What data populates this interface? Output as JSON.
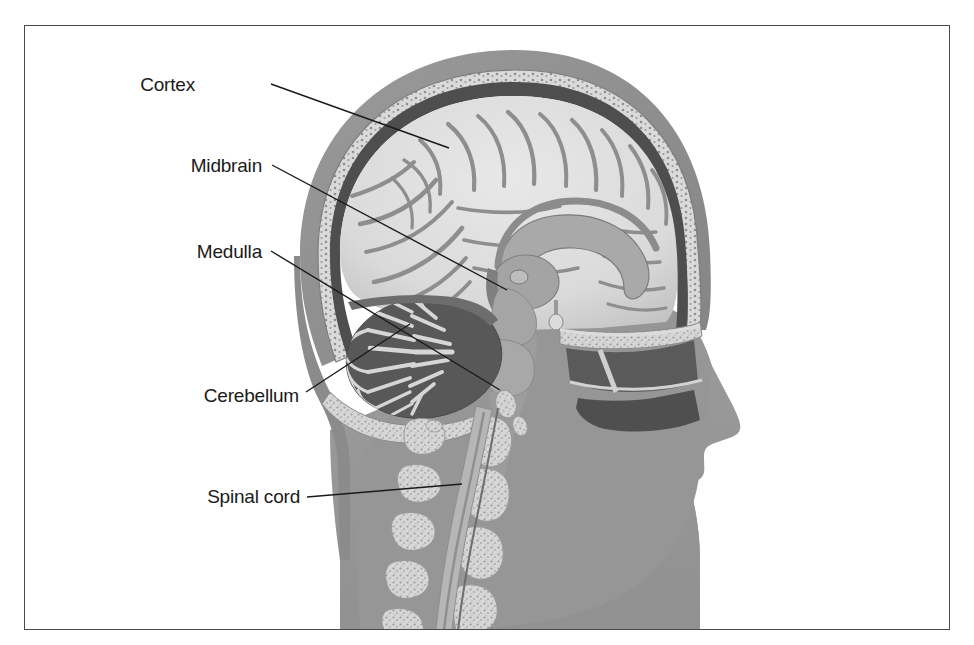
{
  "figure": {
    "kind": "anatomical-illustration",
    "view": "lateral midsagittal cutaway, facing right",
    "border_color": "#4a4a4a",
    "background_color": "#ffffff",
    "top_partial_text": ""
  },
  "palette": {
    "page_background": "#ffffff",
    "frame_border": "#4a4a4a",
    "label_text": "#1a1a1a",
    "leader_line": "#1a1a1a",
    "scalp_outer": "#8e8e8e",
    "scalp_dark": "#6f6f6f",
    "skull_bone": "#d2d2d2",
    "dura_dark": "#4e4e4e",
    "brain_tissue": "#dcdcdc",
    "brain_sulci": "#8a8a8a",
    "brainstem": "#9d9d9d",
    "cerebellum_light": "#d8d8d8",
    "cerebellum_dark": "#5e5e5e",
    "face_silhouette": "#969696",
    "vertebra_bone": "#d9d9d9",
    "sinus_cavity": "#5a5a5a",
    "spinal_canal": "#b0b0b0"
  },
  "labels": [
    {
      "id": "cortex",
      "text": "Cortex",
      "text_x": 195,
      "text_y": 91,
      "leader": "M271,84 L449,148",
      "target_structure": "cerebral cortex"
    },
    {
      "id": "midbrain",
      "text": "Midbrain",
      "text_x": 183,
      "text_y": 172,
      "leader": "M272,165 L507,290",
      "target_structure": "midbrain"
    },
    {
      "id": "medulla",
      "text": "Medulla",
      "text_x": 190,
      "text_y": 258,
      "leader": "M271,251 L500,390",
      "target_structure": "medulla oblongata"
    },
    {
      "id": "cerebellum",
      "text": "Cerebellum",
      "text_x": 186,
      "text_y": 402,
      "leader": "M303,394 L408,325",
      "target_structure": "cerebellum"
    },
    {
      "id": "spinal-cord",
      "text": "Spinal cord",
      "text_x": 194,
      "text_y": 502,
      "leader": "M303,497 L460,485",
      "target_structure": "spinal cord"
    }
  ],
  "structures": [
    {
      "id": "scalp",
      "name": "Scalp / outer soft tissue"
    },
    {
      "id": "skull",
      "name": "Skull bone (diploe)"
    },
    {
      "id": "dura",
      "name": "Dura mater"
    },
    {
      "id": "cerebrum",
      "name": "Cerebral hemisphere with gyri and sulci"
    },
    {
      "id": "corpus-callosum",
      "name": "Corpus callosum"
    },
    {
      "id": "thalamus",
      "name": "Thalamus"
    },
    {
      "id": "midbrain",
      "name": "Midbrain"
    },
    {
      "id": "pons",
      "name": "Pons"
    },
    {
      "id": "medulla",
      "name": "Medulla oblongata"
    },
    {
      "id": "cerebellum",
      "name": "Cerebellum with arbor vitae"
    },
    {
      "id": "spinal-cord",
      "name": "Spinal cord"
    },
    {
      "id": "vertebrae",
      "name": "Cervical vertebrae"
    },
    {
      "id": "sinuses",
      "name": "Nasal and sphenoid sinuses"
    },
    {
      "id": "face",
      "name": "Facial profile silhouette"
    }
  ]
}
